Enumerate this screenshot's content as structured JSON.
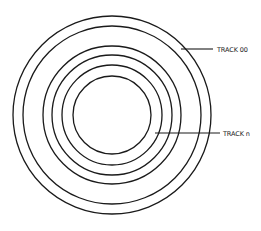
{
  "diagram": {
    "type": "concentric-tracks",
    "track_count_drawn": 6,
    "labels": {
      "outer": "TRACK 00",
      "inner": "TRACK n"
    },
    "colors": {
      "stroke": "#1a1a1a",
      "background": "#ffffff",
      "text": "#222222"
    }
  }
}
